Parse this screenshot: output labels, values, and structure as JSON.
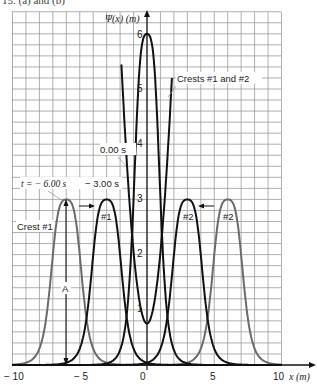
{
  "caption": "15. (a) and (b)",
  "chart_data": {
    "type": "line",
    "title": "",
    "xlabel": "x (m)",
    "ylabel": "Ψ(x) (m)",
    "xlim": [
      -10,
      10
    ],
    "ylim": [
      0,
      6.2
    ],
    "x_ticks": [
      "−10",
      "−5",
      "0",
      "5",
      "10"
    ],
    "y_ticks": [
      "1",
      "2",
      "3",
      "4",
      "5",
      "6"
    ],
    "grid": true,
    "series": [
      {
        "name": "Crest #1 at t = −6.00 s",
        "color": "#6b6b6b",
        "shape": "pulse",
        "center": -6,
        "amplitude": 3
      },
      {
        "name": "Crest #2 at t = −6.00 s",
        "color": "#6b6b6b",
        "shape": "pulse",
        "center": 6,
        "amplitude": 3
      },
      {
        "name": "Crest #1 at t = −3.00 s",
        "color": "#111111",
        "shape": "pulse",
        "center": -3,
        "amplitude": 3
      },
      {
        "name": "Crest #2 at t = −3.00 s",
        "color": "#111111",
        "shape": "pulse",
        "center": 3,
        "amplitude": 3
      },
      {
        "name": "Crests #1 and #2 at t = 0.00 s",
        "color": "#111111",
        "shape": "pulse",
        "center": 0,
        "amplitude": 6
      }
    ],
    "annotations": [
      "t = −6.00 s",
      "−3.00 s",
      "0.00 s",
      "Crests #1 and #2",
      "Crest #1",
      "#1",
      "#2",
      "#2",
      "A"
    ]
  },
  "labels": {
    "y_axis": "Ψ(x)  (m)",
    "x_axis": "x  (m)",
    "t_minus6": "t =  − 6.00  s",
    "t_minus3": "− 3.00  s",
    "t_zero": "0.00  s",
    "crests_both": "Crests #1 and #2",
    "crest1": "Crest #1",
    "c1": "#1",
    "c2a": "#2",
    "c2b": "#2",
    "amp": "A",
    "xt": [
      "− 10",
      "− 5",
      "0",
      "5",
      "10"
    ],
    "yt": [
      "1",
      "2",
      "3",
      "4",
      "5",
      "6"
    ]
  }
}
